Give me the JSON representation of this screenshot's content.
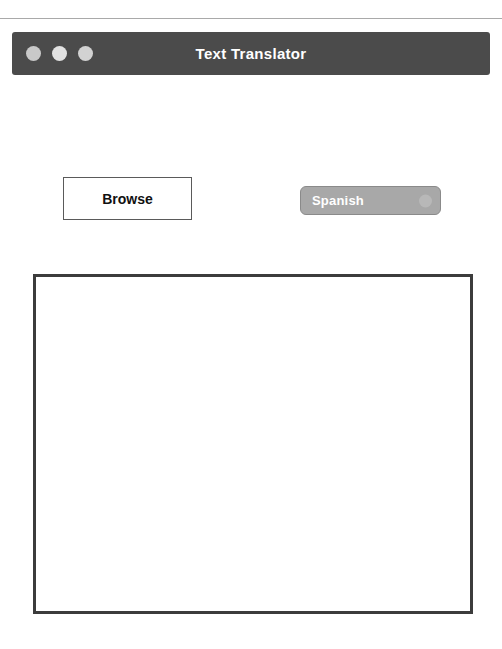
{
  "window": {
    "title": "Text Translator",
    "controls": [
      {
        "name": "close",
        "color": "#c9c9c9"
      },
      {
        "name": "minimize",
        "color": "#e2e2e2"
      },
      {
        "name": "maximize",
        "color": "#d2d2d2"
      }
    ],
    "titlebar_color": "#4b4b4b",
    "title_color": "#ffffff"
  },
  "toolbar": {
    "browse_label": "Browse",
    "language": {
      "selected": "Spanish",
      "options": [
        "Spanish"
      ],
      "background": "#a8a8a8",
      "text_color": "#ffffff"
    }
  },
  "editor": {
    "value": "",
    "placeholder": "",
    "border_color": "#3c3c3c",
    "background": "#ffffff"
  },
  "page": {
    "background": "#ffffff",
    "rule_color": "#a9a9a9"
  }
}
